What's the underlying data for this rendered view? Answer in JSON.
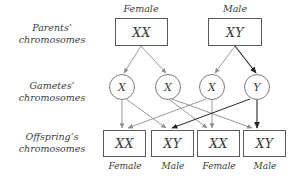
{
  "diagram": {
    "row_labels": [
      {
        "line1": "Parents’",
        "line2": "chromosomes"
      },
      {
        "line1": "Gametes’",
        "line2": "chromosomes"
      },
      {
        "line1": "Offspring’s",
        "line2": "chromosomes"
      }
    ],
    "parent_headers": [
      {
        "label": "Female"
      },
      {
        "label": "Male"
      }
    ],
    "parents": [
      {
        "genotype": "XX",
        "sex": "Female"
      },
      {
        "genotype": "XY",
        "sex": "Male"
      }
    ],
    "gametes": [
      {
        "allele": "X",
        "from": "Female"
      },
      {
        "allele": "X",
        "from": "Female"
      },
      {
        "allele": "X",
        "from": "Male"
      },
      {
        "allele": "Y",
        "from": "Male"
      }
    ],
    "offspring": [
      {
        "genotype": "XX",
        "sex": "Female"
      },
      {
        "genotype": "XY",
        "sex": "Male"
      },
      {
        "genotype": "XX",
        "sex": "Female"
      },
      {
        "genotype": "XY",
        "sex": "Male"
      }
    ],
    "colors": {
      "background": "#ffffff",
      "box_stroke": "#5a5a5a",
      "circle_stroke": "#7a7a7a",
      "arrow_light": "#8f8f8f",
      "arrow_dark": "#262626",
      "text": "#3a3a3a"
    }
  }
}
